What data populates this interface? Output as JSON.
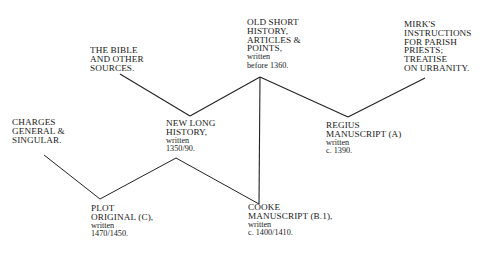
{
  "diagram": {
    "type": "manuscript-stemma",
    "line_color": "#222222",
    "text_color": "#1a1a1a",
    "nodes": {
      "bible": {
        "lines": [
          "THE BIBLE",
          "AND OTHER",
          "SOURCES."
        ],
        "sub": []
      },
      "old_short": {
        "lines": [
          "OLD SHORT",
          "HISTORY,",
          "ARTICLES &",
          "POINTS,"
        ],
        "sub": [
          "written",
          "before 1360."
        ]
      },
      "mirk": {
        "lines": [
          "MIRK'S",
          "INSTRUCTIONS",
          "FOR PARISH",
          "PRIESTS;",
          "TREATISE",
          "ON URBANITY."
        ],
        "sub": []
      },
      "charges": {
        "lines": [
          "CHARGES",
          "GENERAL &",
          "SINGULAR."
        ],
        "sub": []
      },
      "new_long": {
        "lines": [
          "NEW LONG",
          "HISTORY,"
        ],
        "sub": [
          "written",
          "1350/90."
        ]
      },
      "regius": {
        "lines": [
          "REGIUS",
          "MANUSCRIPT (A)"
        ],
        "sub": [
          "written",
          "c. 1390."
        ]
      },
      "plot": {
        "lines": [
          "PLOT",
          "ORIGINAL (C),"
        ],
        "sub": [
          "written",
          "1470/1450."
        ]
      },
      "cooke": {
        "lines": [
          "COOKE",
          "MANUSCRIPT (B.1),"
        ],
        "sub": [
          "written",
          "c. 1400/1410."
        ]
      }
    },
    "edges": [
      {
        "from": "bible",
        "to": "new_long",
        "x1": 120,
        "y1": 74,
        "x2": 190,
        "y2": 116
      },
      {
        "from": "new_long",
        "to": "old_short",
        "x1": 190,
        "y1": 116,
        "x2": 260,
        "y2": 77
      },
      {
        "from": "old_short",
        "to": "regius",
        "x1": 260,
        "y1": 77,
        "x2": 348,
        "y2": 117
      },
      {
        "from": "regius",
        "to": "mirk",
        "x1": 348,
        "y1": 117,
        "x2": 425,
        "y2": 78
      },
      {
        "from": "old_short",
        "to": "cooke",
        "x1": 260,
        "y1": 77,
        "x2": 259,
        "y2": 204
      },
      {
        "from": "charges",
        "to": "plot",
        "x1": 44,
        "y1": 155,
        "x2": 100,
        "y2": 199
      },
      {
        "from": "plot",
        "to": "new_long",
        "x1": 100,
        "y1": 199,
        "x2": 176,
        "y2": 158
      },
      {
        "from": "new_long",
        "to": "cooke",
        "x1": 176,
        "y1": 158,
        "x2": 259,
        "y2": 204
      }
    ]
  }
}
